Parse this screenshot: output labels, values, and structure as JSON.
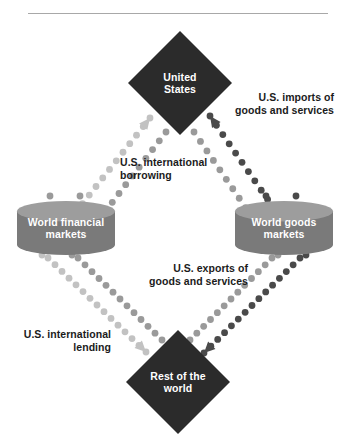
{
  "figure": {
    "bottom_caption": ""
  },
  "colors": {
    "node_dark": "#2b2b2b",
    "cylinder_body": "#7a7a7a",
    "cylinder_top": "#9d9d9d",
    "dots_light": "#c2c2c2",
    "dots_mid": "#9a9a9a",
    "dots_dark": "#4a4a4a",
    "text_dark": "#1b1b1b",
    "text_light": "#ffffff",
    "rule": "#a8a8a8",
    "background": "#ffffff"
  },
  "nodes": [
    {
      "id": "united-states",
      "shape": "diamond",
      "lines": [
        "United",
        "States"
      ],
      "cx": 180,
      "cy": 83,
      "rx": 52,
      "ry": 52
    },
    {
      "id": "world-financial-markets",
      "shape": "cylinder",
      "lines": [
        "World financial",
        "markets"
      ],
      "cx": 66,
      "cy": 228,
      "rx": 49,
      "ry": 27
    },
    {
      "id": "world-goods-markets",
      "shape": "cylinder",
      "lines": [
        "World goods",
        "markets"
      ],
      "cx": 284,
      "cy": 228,
      "rx": 49,
      "ry": 27
    },
    {
      "id": "rest-of-the-world",
      "shape": "diamond",
      "lines": [
        "Rest of the",
        "world"
      ],
      "cx": 178,
      "cy": 382,
      "rx": 52,
      "ry": 52
    }
  ],
  "flows": [
    {
      "id": "us-international-borrowing",
      "lines": [
        "U.S. international",
        "borrowing"
      ],
      "label_x": 120,
      "label_y": 166,
      "anchor": "start",
      "tone": "dots_light",
      "from": "world-financial-markets",
      "to": "united-states",
      "direction": "up-right"
    },
    {
      "id": "us-imports-of-goods-and-services",
      "lines": [
        "U.S. imports of",
        "goods and services"
      ],
      "label_x": 334,
      "label_y": 101,
      "anchor": "end",
      "tone": "dots_dark",
      "from": "world-goods-markets",
      "to": "united-states",
      "direction": "up-left"
    },
    {
      "id": "us-exports-of-goods-and-services",
      "lines": [
        "U.S. exports of",
        "goods and services"
      ],
      "label_x": 248,
      "label_y": 272,
      "anchor": "end",
      "tone": "dots_dark",
      "from": "world-goods-markets",
      "to": "rest-of-the-world",
      "direction": "down-left"
    },
    {
      "id": "us-international-lending",
      "lines": [
        "U.S. international",
        "lending"
      ],
      "label_x": 111,
      "label_y": 338,
      "anchor": "end",
      "tone": "dots_light",
      "from": "world-financial-markets",
      "to": "rest-of-the-world",
      "direction": "down-right"
    }
  ],
  "dot_paths": [
    {
      "id": "path-borrow-outer",
      "tone": "dots_light",
      "x1": 42,
      "y1": 255,
      "x2": 150,
      "y2": 118,
      "count": 17,
      "r": 3.4,
      "arrow": true,
      "arrow_angle": 308
    },
    {
      "id": "path-borrow-inner",
      "tone": "dots_mid",
      "x1": 72,
      "y1": 255,
      "x2": 166,
      "y2": 132,
      "count": 15,
      "r": 3.4,
      "arrow": false,
      "arrow_angle": 308
    },
    {
      "id": "path-import-outer",
      "tone": "dots_dark",
      "x1": 306,
      "y1": 255,
      "x2": 210,
      "y2": 116,
      "count": 16,
      "r": 3.4,
      "arrow": true,
      "arrow_angle": 235
    },
    {
      "id": "path-import-inner",
      "tone": "dots_mid",
      "x1": 278,
      "y1": 255,
      "x2": 194,
      "y2": 132,
      "count": 14,
      "r": 3.4,
      "arrow": false,
      "arrow_angle": 235
    },
    {
      "id": "path-export-outer",
      "tone": "dots_dark",
      "x1": 300,
      "y1": 258,
      "x2": 204,
      "y2": 353,
      "count": 15,
      "r": 3.4,
      "arrow": true,
      "arrow_angle": 135
    },
    {
      "id": "path-export-inner",
      "tone": "dots_mid",
      "x1": 272,
      "y1": 258,
      "x2": 190,
      "y2": 340,
      "count": 13,
      "r": 3.4,
      "arrow": false,
      "arrow_angle": 135
    },
    {
      "id": "path-lend-outer",
      "tone": "dots_light",
      "x1": 48,
      "y1": 258,
      "x2": 146,
      "y2": 352,
      "count": 15,
      "r": 3.4,
      "arrow": true,
      "arrow_angle": 45
    },
    {
      "id": "path-lend-inner",
      "tone": "dots_mid",
      "x1": 78,
      "y1": 258,
      "x2": 162,
      "y2": 340,
      "count": 13,
      "r": 3.4,
      "arrow": false,
      "arrow_angle": 45
    },
    {
      "id": "path-fin-top-a",
      "tone": "dots_mid",
      "x1": 50,
      "y1": 196,
      "x2": 50,
      "y2": 218,
      "count": 3,
      "r": 3.4,
      "arrow": false,
      "arrow_angle": 90
    },
    {
      "id": "path-fin-top-b",
      "tone": "dots_mid",
      "x1": 80,
      "y1": 196,
      "x2": 80,
      "y2": 218,
      "count": 3,
      "r": 3.4,
      "arrow": false,
      "arrow_angle": 90
    },
    {
      "id": "path-goods-top-a",
      "tone": "dots_dark",
      "x1": 266,
      "y1": 196,
      "x2": 266,
      "y2": 218,
      "count": 3,
      "r": 3.4,
      "arrow": false,
      "arrow_angle": 90
    },
    {
      "id": "path-goods-top-b",
      "tone": "dots_dark",
      "x1": 296,
      "y1": 196,
      "x2": 296,
      "y2": 218,
      "count": 3,
      "r": 3.4,
      "arrow": false,
      "arrow_angle": 90
    }
  ]
}
